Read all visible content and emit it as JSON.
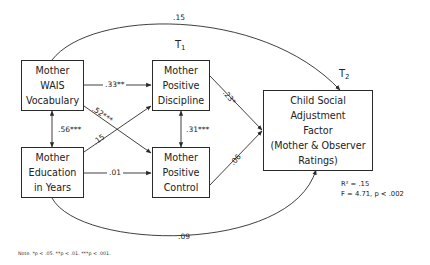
{
  "diagram": {
    "type": "path_model",
    "time_labels": {
      "t1": {
        "base": "T",
        "sub": "1"
      },
      "t2": {
        "base": "T",
        "sub": "2"
      }
    },
    "nodes": {
      "wais": {
        "lines": [
          "Mother",
          "WAIS",
          "Vocabulary"
        ]
      },
      "education": {
        "lines": [
          "Mother",
          "Education",
          "in Years"
        ]
      },
      "discipline": {
        "lines": [
          "Mother",
          "Positive",
          "Discipline"
        ]
      },
      "control": {
        "lines": [
          "Mother",
          "Positive",
          "Control"
        ]
      },
      "child": {
        "lines": [
          "Child Social",
          "Adjustment",
          "Factor",
          "(Mother & Observer",
          "Ratings)"
        ]
      }
    },
    "paths": [
      {
        "from": "wais",
        "to": "discipline",
        "coef": ".33**"
      },
      {
        "from": "wais",
        "to": "control",
        "coef": ".52***"
      },
      {
        "from": "education",
        "to": "discipline",
        "coef": ".15"
      },
      {
        "from": "education",
        "to": "control",
        "coef": ".01"
      },
      {
        "from": "wais",
        "to": "education",
        "coef": ".56***",
        "bidirectional": true
      },
      {
        "from": "discipline",
        "to": "control",
        "coef": ".31***",
        "bidirectional": true
      },
      {
        "from": "discipline",
        "to": "child",
        "coef": ".23*"
      },
      {
        "from": "control",
        "to": "child",
        "coef": ".06"
      },
      {
        "from": "wais",
        "to": "child",
        "coef": ".15"
      },
      {
        "from": "education",
        "to": "child",
        "coef": ".09"
      }
    ],
    "stats": {
      "r2": "R² = .15",
      "f": "F = 4.71, p < .002"
    },
    "note": "Note. *p < .05. **p < .01. ***p < .001."
  }
}
